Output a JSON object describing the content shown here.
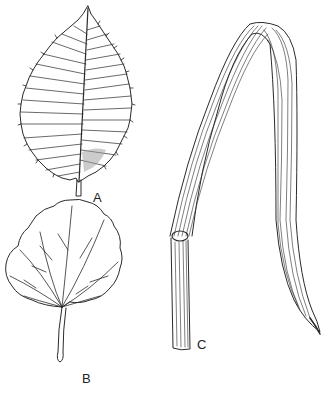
{
  "figure": {
    "panels": [
      {
        "id": "A",
        "label": "A",
        "description": "pinnately veined serrate leaf"
      },
      {
        "id": "B",
        "label": "B",
        "description": "palmately veined round leaf with petiole"
      },
      {
        "id": "C",
        "label": "C",
        "description": "parallel-veined grass leaf blade with sheath"
      }
    ],
    "colors": {
      "ink": "#2a2a2a",
      "background": "#ffffff"
    }
  }
}
